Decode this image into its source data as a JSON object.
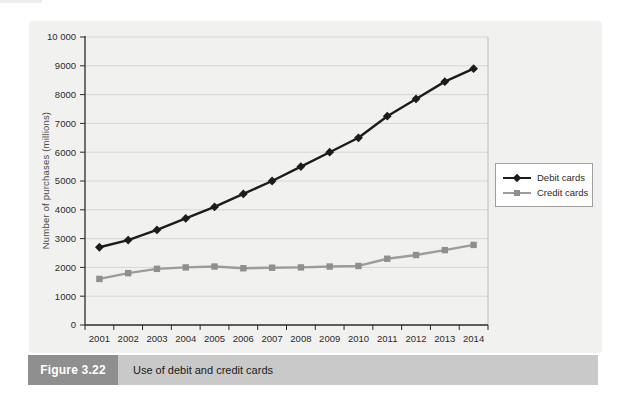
{
  "figure": {
    "label": "Figure 3.22",
    "caption": "Use of debit and credit cards"
  },
  "chart_data": {
    "type": "line",
    "title": "",
    "xlabel": "",
    "ylabel": "Number of purchases (millions)",
    "x": [
      "2001",
      "2002",
      "2003",
      "2004",
      "2005",
      "2006",
      "2007",
      "2008",
      "2009",
      "2010",
      "2011",
      "2012",
      "2013",
      "2014"
    ],
    "series": [
      {
        "name": "Debit cards",
        "marker": "diamond",
        "line_color": "#1c1c1c",
        "marker_color": "#1c1c1c",
        "values": [
          2700,
          2950,
          3300,
          3700,
          4100,
          4550,
          5000,
          5500,
          6000,
          6500,
          7250,
          7850,
          8450,
          8900
        ]
      },
      {
        "name": "Credit cards",
        "marker": "square",
        "line_color": "#9c9c9c",
        "marker_color": "#8f8f8f",
        "values": [
          1600,
          1800,
          1950,
          2000,
          2030,
          1970,
          1990,
          2000,
          2030,
          2050,
          2300,
          2430,
          2600,
          2780
        ]
      }
    ],
    "ylim": [
      0,
      10000
    ],
    "ytick_interval": 1000,
    "ytick_labels": [
      "0",
      "1000",
      "2000",
      "3000",
      "4000",
      "5000",
      "6000",
      "7000",
      "8000",
      "9000",
      "10 000"
    ],
    "grid": "horizontal",
    "legend_position": "right-outside"
  },
  "style_colors": {
    "panel_bg": "#f1f1ef",
    "gridline": "#d6d6d4",
    "plot_right_border": "#bcbcba",
    "axis": "#2b2b2b",
    "caption_bar_bg": "#c9c9c9",
    "figure_label_bg": "#8f8f8f"
  }
}
